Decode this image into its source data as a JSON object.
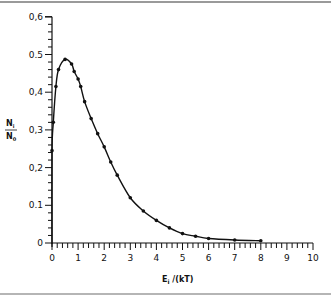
{
  "chart_data": {
    "type": "line",
    "title": "",
    "xlabel": "E_i /(kT)",
    "ylabel": "N_i / N_0",
    "xlim": [
      0,
      10
    ],
    "ylim": [
      0,
      0.6
    ],
    "grid": false,
    "legend": null,
    "x_ticks": [
      "0",
      "1",
      "2",
      "3",
      "4",
      "5",
      "6",
      "7",
      "8",
      "9",
      "10"
    ],
    "y_ticks": [
      "0",
      "0.1",
      "0.2",
      "0.3",
      "0.4",
      "0.5",
      "0.6"
    ],
    "y_tick_display": [
      "0",
      "0.1",
      "0,2",
      "0,3",
      "0,4",
      "0.5",
      "0,6"
    ],
    "series": [
      {
        "name": "N_i/N_0",
        "marker": "dot",
        "x": [
          0.0,
          0.05,
          0.15,
          0.25,
          0.5,
          0.75,
          0.85,
          1.0,
          1.1,
          1.25,
          1.5,
          1.75,
          2.0,
          2.25,
          2.5,
          3.0,
          3.5,
          4.0,
          4.5,
          5.0,
          5.5,
          6.0,
          7.0,
          8.0
        ],
        "values": [
          0.245,
          0.32,
          0.415,
          0.46,
          0.487,
          0.475,
          0.455,
          0.435,
          0.415,
          0.375,
          0.33,
          0.29,
          0.255,
          0.215,
          0.18,
          0.12,
          0.085,
          0.06,
          0.04,
          0.025,
          0.018,
          0.012,
          0.008,
          0.006
        ]
      }
    ]
  },
  "labels": {
    "xlabel_main": "E",
    "xlabel_sub": "i",
    "xlabel_rest": " /(kT)",
    "ylabel_num": "N",
    "ylabel_num_sub": "i",
    "ylabel_den": "N",
    "ylabel_den_sub": "0"
  }
}
